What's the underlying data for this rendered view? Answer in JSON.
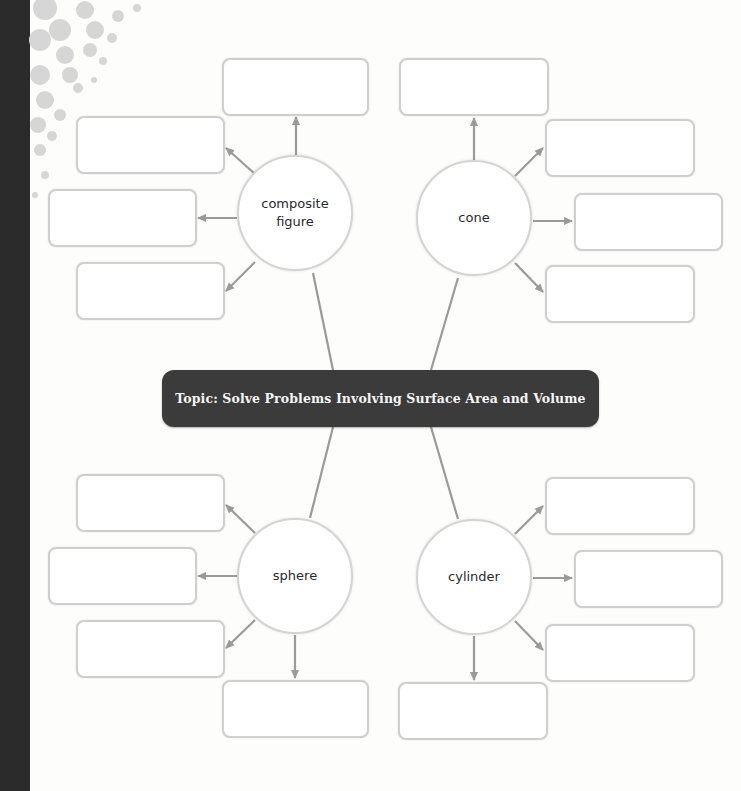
{
  "topic": {
    "label": "Topic: Solve Problems Involving Surface Area and Volume"
  },
  "nodes": [
    {
      "label": "composite figure",
      "answer_boxes": [
        "",
        "",
        "",
        ""
      ]
    },
    {
      "label": "cone",
      "answer_boxes": [
        "",
        "",
        "",
        ""
      ]
    },
    {
      "label": "sphere",
      "answer_boxes": [
        "",
        "",
        "",
        ""
      ]
    },
    {
      "label": "cylinder",
      "answer_boxes": [
        "",
        "",
        "",
        ""
      ]
    }
  ],
  "colors": {
    "banner": "#3b3b3b",
    "connector": "#9a9a9a",
    "spine": "#2b2b2b"
  }
}
